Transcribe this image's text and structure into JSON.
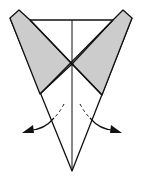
{
  "diagram": {
    "type": "origami-fold-step",
    "colors": {
      "line": "#111111",
      "shade": "#cccccc",
      "background": "#ffffff"
    },
    "elements": {
      "center_crease": "vertical center line",
      "left_flap": "shaded left flap",
      "right_flap": "shaded right flap",
      "left_arrow": "fold left flap outward",
      "right_arrow": "fold right flap outward"
    }
  }
}
